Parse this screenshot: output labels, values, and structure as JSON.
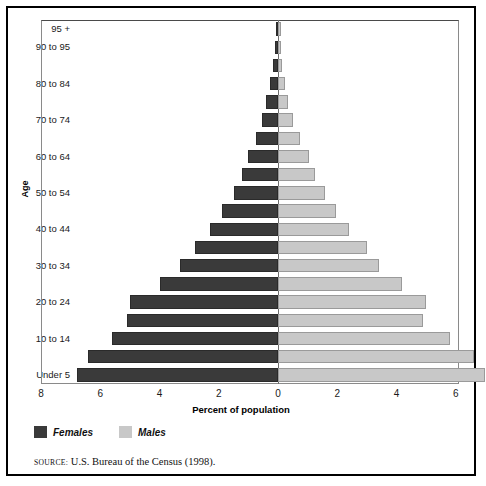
{
  "chart_data": {
    "type": "bar",
    "subtype": "population-pyramid",
    "title": "",
    "xlabel": "Percent of population",
    "ylabel": "Age",
    "xlim": [
      -8,
      8
    ],
    "xticks": [
      8,
      6,
      4,
      2,
      0,
      2,
      4,
      6,
      8
    ],
    "grid": false,
    "legend_position": "below-left",
    "categories": [
      "Under 5",
      "5 to 9",
      "10 to 14",
      "15 to 19",
      "20 to 24",
      "25 to 29",
      "30 to 34",
      "35 to 39",
      "40 to 44",
      "45 to 49",
      "50 to 54",
      "55 to 59",
      "60 to 64",
      "65 to 69",
      "70 to 74",
      "75 to 79",
      "80 to 84",
      "85 to 89",
      "90 to 95",
      "95 +"
    ],
    "visible_tick_labels": [
      "Under 5",
      "10 to 14",
      "20 to 24",
      "30 to 34",
      "40 to 44",
      "50 to 54",
      "60 to 64",
      "70 to 74",
      "80 to 84",
      "90 to 95",
      "95 +"
    ],
    "series": [
      {
        "name": "Females",
        "side": "left",
        "color": "#3a3a3a",
        "values": [
          6.8,
          6.4,
          5.6,
          5.1,
          5.0,
          4.0,
          3.3,
          2.8,
          2.3,
          1.9,
          1.5,
          1.2,
          1.0,
          0.75,
          0.55,
          0.4,
          0.28,
          0.18,
          0.1,
          0.06
        ]
      },
      {
        "name": "Males",
        "side": "right",
        "color": "#c8c8c8",
        "values": [
          7.0,
          6.6,
          5.8,
          4.9,
          5.0,
          4.2,
          3.4,
          3.0,
          2.4,
          1.95,
          1.6,
          1.25,
          1.05,
          0.75,
          0.5,
          0.35,
          0.25,
          0.15,
          0.08,
          0.05
        ]
      }
    ]
  },
  "axis": {
    "y_label": "Age",
    "x_label": "Percent of population"
  },
  "legend": {
    "females_label": "Females",
    "males_label": "Males",
    "females_color": "#3a3a3a",
    "males_color": "#c8c8c8"
  },
  "source": {
    "keyword": "SOURCE:",
    "text": "U.S. Bureau of the Census (1998)."
  }
}
